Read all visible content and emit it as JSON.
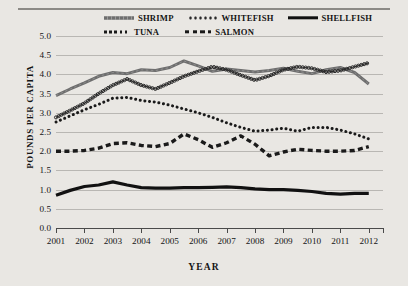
{
  "chart_data": {
    "type": "line",
    "title": "",
    "xlabel": "YEAR",
    "ylabel": "POUNDS PER CAPITA",
    "ylim": [
      0.0,
      5.0
    ],
    "ytick_step": 0.5,
    "yticks": [
      "5.0",
      "4.5",
      "4.0",
      "3.5",
      "3.0",
      "2.5",
      "2.0",
      "1.5",
      "1.0",
      "0.5",
      "0.0"
    ],
    "xticks": [
      "2001",
      "2002",
      "2003",
      "2004",
      "2005",
      "2006",
      "2007",
      "2008",
      "2009",
      "2010",
      "2011",
      "2012"
    ],
    "xlim": [
      2001,
      2012.5
    ],
    "grid": true,
    "legend_position": "top",
    "x": [
      2001.0,
      2001.5,
      2002.0,
      2002.5,
      2003.0,
      2003.5,
      2004.0,
      2004.5,
      2005.0,
      2005.5,
      2006.0,
      2006.5,
      2007.0,
      2007.5,
      2008.0,
      2008.5,
      2009.0,
      2009.5,
      2010.0,
      2010.5,
      2011.0,
      2011.5,
      2012.0
    ],
    "series": [
      {
        "name": "SHRIMP",
        "color": "#6e6e6e",
        "style": "solid-thick",
        "values": [
          3.45,
          3.62,
          3.78,
          3.95,
          4.05,
          4.02,
          4.12,
          4.1,
          4.18,
          4.35,
          4.22,
          4.08,
          4.14,
          4.1,
          4.06,
          4.1,
          4.16,
          4.08,
          4.02,
          4.12,
          4.18,
          4.05,
          3.75
        ]
      },
      {
        "name": "WHITEFISH",
        "color": "#2a2a2a",
        "style": "chain-circles",
        "values": [
          2.88,
          3.06,
          3.25,
          3.5,
          3.72,
          3.88,
          3.72,
          3.62,
          3.78,
          3.95,
          4.08,
          4.2,
          4.12,
          3.98,
          3.85,
          3.96,
          4.12,
          4.2,
          4.16,
          4.06,
          4.1,
          4.2,
          4.3
        ]
      },
      {
        "name": "SHELLFISH",
        "color": "#111111",
        "style": "solid-bold",
        "values": [
          0.85,
          0.98,
          1.08,
          1.12,
          1.2,
          1.12,
          1.05,
          1.04,
          1.04,
          1.05,
          1.05,
          1.06,
          1.07,
          1.05,
          1.02,
          1.0,
          1.0,
          0.98,
          0.95,
          0.9,
          0.88,
          0.9,
          0.9
        ]
      },
      {
        "name": "TUNA",
        "color": "#1a1a1a",
        "style": "dotted",
        "values": [
          2.76,
          2.92,
          3.08,
          3.22,
          3.38,
          3.4,
          3.32,
          3.28,
          3.2,
          3.1,
          3.0,
          2.88,
          2.74,
          2.62,
          2.52,
          2.55,
          2.6,
          2.52,
          2.62,
          2.62,
          2.55,
          2.45,
          2.32
        ]
      },
      {
        "name": "SALMON",
        "color": "#1a1a1a",
        "style": "dashed",
        "values": [
          2.0,
          2.0,
          2.02,
          2.08,
          2.2,
          2.22,
          2.15,
          2.12,
          2.2,
          2.45,
          2.3,
          2.1,
          2.22,
          2.4,
          2.18,
          1.88,
          1.98,
          2.05,
          2.02,
          2.0,
          2.0,
          2.02,
          2.12
        ]
      }
    ]
  }
}
